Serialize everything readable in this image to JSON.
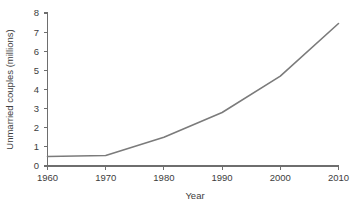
{
  "chart_data": {
    "type": "line",
    "title": "",
    "subtitle": "",
    "xlabel": "Year",
    "ylabel": "Unmarried couples (millions)",
    "x": [
      1960,
      1970,
      1980,
      1990,
      2000,
      2010
    ],
    "values": [
      0.5,
      0.55,
      1.5,
      2.8,
      4.7,
      7.45
    ],
    "series": [
      {
        "name": "Unmarried couples",
        "values": [
          0.5,
          0.55,
          1.5,
          2.8,
          4.7,
          7.45
        ]
      }
    ],
    "xlim": [
      1960,
      2010
    ],
    "ylim": [
      0,
      8
    ],
    "xticks": [
      1960,
      1970,
      1980,
      1990,
      2000,
      2010
    ],
    "yticks": [
      0,
      1,
      2,
      3,
      4,
      5,
      6,
      7,
      8
    ],
    "xtick_labels": [
      "1960",
      "1970",
      "1980",
      "1990",
      "2000",
      "2010"
    ],
    "ytick_labels": [
      "0",
      "1",
      "2",
      "3",
      "4",
      "5",
      "6",
      "7",
      "8"
    ],
    "grid": false,
    "legend": false,
    "legend_position": "none",
    "markers": false,
    "line_color": "#7b7b7b",
    "axis_color": "#6e6e6e",
    "text_color": "#3d3d3d",
    "background_color": "#ffffff"
  },
  "axes": {
    "y_title": "Unmarried couples (millions)",
    "x_title": "Year",
    "ytick_0": "0",
    "ytick_1": "1",
    "ytick_2": "2",
    "ytick_3": "3",
    "ytick_4": "4",
    "ytick_5": "5",
    "ytick_6": "6",
    "ytick_7": "7",
    "ytick_8": "8",
    "xtick_0": "1960",
    "xtick_1": "1970",
    "xtick_2": "1980",
    "xtick_3": "1990",
    "xtick_4": "2000",
    "xtick_5": "2010"
  }
}
